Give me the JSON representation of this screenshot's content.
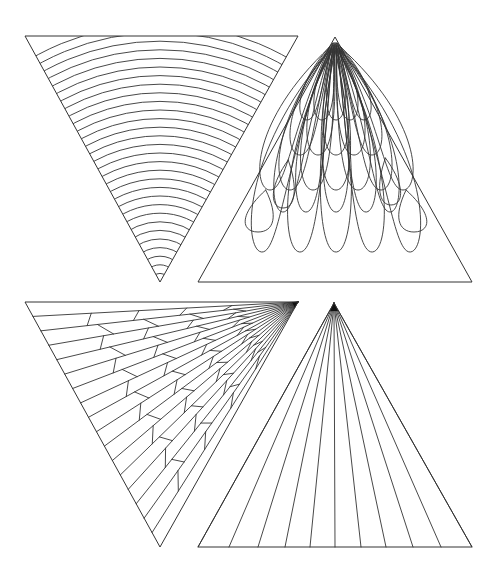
{
  "figure": {
    "width": 504,
    "height": 581,
    "background": "#ffffff",
    "stroke_color": "#333333",
    "panels": [
      {
        "id": "concentric-arcs",
        "description": "Inverted triangle filled with concentric arcs centered at bottom vertex",
        "vertices": [
          [
            25,
            36
          ],
          [
            298,
            36
          ],
          [
            160,
            282
          ]
        ],
        "arc_center": [
          160,
          282
        ],
        "arc_count": 30
      },
      {
        "id": "scales",
        "description": "Upright triangle with rows of elongated scale/petal loops fanning from apex",
        "vertices": [
          [
            335,
            37
          ],
          [
            198,
            282
          ],
          [
            472,
            282
          ]
        ],
        "rows": 5
      },
      {
        "id": "web",
        "description": "Inverted triangle with rays from top-right vertex and zigzag cross connections",
        "vertices": [
          [
            25,
            302
          ],
          [
            298,
            302
          ],
          [
            160,
            547
          ]
        ],
        "ray_origin": [
          298,
          302
        ],
        "ray_count": 16
      },
      {
        "id": "fan",
        "description": "Upright triangle with straight lines fanning from apex to base",
        "vertices": [
          [
            334,
            303
          ],
          [
            198,
            547
          ],
          [
            472,
            547
          ]
        ],
        "base_x": [
          198,
          229,
          258,
          285,
          310,
          335,
          361,
          386,
          413,
          441,
          472
        ]
      }
    ]
  }
}
